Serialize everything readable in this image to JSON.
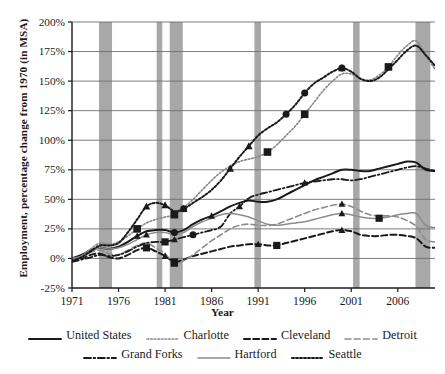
{
  "axes": {
    "ylabel": "Employment, percentage change from 1970 (in MSA)",
    "xlabel": "Year",
    "yticks": [
      "200%",
      "175%",
      "150%",
      "125%",
      "100%",
      "75%",
      "50%",
      "25%",
      "0%",
      "-25%"
    ],
    "xticks": [
      "1971",
      "1976",
      "1981",
      "1986",
      "1991",
      "1996",
      "2001",
      "2006"
    ]
  },
  "legend": {
    "row1": [
      {
        "label": "United States",
        "style": "solid-dark"
      },
      {
        "label": "Charlotte",
        "style": "dotted-gray"
      },
      {
        "label": "Cleveland",
        "style": "dashed-dark"
      },
      {
        "label": "Detroit",
        "style": "dashed-gray"
      }
    ],
    "row2": [
      {
        "label": "Grand Forks",
        "style": "dashdot-dark"
      },
      {
        "label": "Hartford",
        "style": "solid-gray"
      },
      {
        "label": "Seattle",
        "style": "dotted-dark"
      }
    ]
  },
  "colors": {
    "dark": "#1a1a1a",
    "gray": "#8c8c8c",
    "recession_band": "#a8a8a8",
    "gridline": "#6e6e6e",
    "axis": "#1a1a1a",
    "background": "#ffffff"
  },
  "chart_data": {
    "type": "line",
    "title": "",
    "xlabel": "Year",
    "ylabel": "Employment, percentage change from 1970 (in MSA)",
    "xlim": [
      1971,
      2010
    ],
    "ylim": [
      -25,
      200
    ],
    "ytick_values": [
      -25,
      0,
      25,
      50,
      75,
      100,
      125,
      150,
      175,
      200
    ],
    "xtick_values": [
      1971,
      1976,
      1981,
      1986,
      1991,
      1996,
      2001,
      2006
    ],
    "grid": "horizontal",
    "legend_position": "bottom",
    "units": "percent change from 1970",
    "recession_bands": [
      {
        "start": 1973.9,
        "end": 1975.3
      },
      {
        "start": 1980.1,
        "end": 1980.7
      },
      {
        "start": 1981.5,
        "end": 1982.9
      },
      {
        "start": 1990.6,
        "end": 1991.3
      },
      {
        "start": 2001.2,
        "end": 2001.9
      },
      {
        "start": 2007.9,
        "end": 2009.5
      }
    ],
    "x": [
      1971,
      1972,
      1973,
      1974,
      1975,
      1976,
      1977,
      1978,
      1979,
      1980,
      1981,
      1982,
      1983,
      1984,
      1985,
      1986,
      1987,
      1988,
      1989,
      1990,
      1991,
      1992,
      1993,
      1994,
      1995,
      1996,
      1997,
      1998,
      1999,
      2000,
      2001,
      2002,
      2003,
      2004,
      2005,
      2006,
      2007,
      2008,
      2009,
      2010
    ],
    "series": [
      {
        "name": "United States",
        "style": "solid-dark",
        "values": [
          0,
          3,
          7,
          9,
          8,
          10,
          14,
          19,
          23,
          24,
          24,
          22,
          24,
          29,
          33,
          36,
          40,
          44,
          47,
          49,
          48,
          48,
          50,
          54,
          58,
          62,
          66,
          69,
          72,
          75,
          75,
          74,
          74,
          76,
          78,
          80,
          82,
          81,
          75,
          74
        ]
      },
      {
        "name": "Charlotte",
        "style": "dotted-gray",
        "values": [
          -2,
          2,
          8,
          13,
          12,
          14,
          19,
          25,
          30,
          33,
          35,
          37,
          43,
          50,
          58,
          66,
          73,
          78,
          82,
          84,
          86,
          90,
          96,
          104,
          112,
          122,
          132,
          142,
          150,
          156,
          156,
          152,
          151,
          155,
          162,
          172,
          180,
          184,
          172,
          160
        ]
      },
      {
        "name": "Cleveland",
        "style": "dashed-dark",
        "values": [
          -2,
          0,
          3,
          4,
          1,
          0,
          3,
          7,
          9,
          6,
          2,
          -3,
          -1,
          2,
          4,
          6,
          8,
          10,
          11,
          12,
          12,
          11,
          11,
          13,
          15,
          17,
          19,
          21,
          23,
          24,
          23,
          20,
          19,
          19,
          20,
          20,
          19,
          17,
          10,
          9
        ]
      },
      {
        "name": "Detroit",
        "style": "dashed-gray",
        "values": [
          -1,
          1,
          5,
          7,
          4,
          3,
          7,
          11,
          13,
          9,
          4,
          -4,
          -2,
          3,
          9,
          15,
          20,
          25,
          28,
          29,
          28,
          28,
          29,
          32,
          35,
          38,
          41,
          43,
          45,
          46,
          44,
          40,
          37,
          36,
          36,
          35,
          32,
          27,
          16,
          14
        ]
      },
      {
        "name": "Grand Forks",
        "style": "dashdot-dark",
        "values": [
          -3,
          -1,
          1,
          3,
          2,
          3,
          6,
          10,
          13,
          14,
          14,
          16,
          18,
          20,
          22,
          24,
          27,
          38,
          44,
          51,
          54,
          56,
          58,
          60,
          62,
          64,
          65,
          66,
          67,
          67,
          66,
          67,
          69,
          71,
          73,
          75,
          77,
          78,
          76,
          74
        ]
      },
      {
        "name": "Hartford",
        "style": "solid-gray",
        "values": [
          0,
          2,
          6,
          9,
          8,
          9,
          12,
          16,
          20,
          22,
          22,
          20,
          22,
          27,
          31,
          34,
          37,
          38,
          37,
          35,
          32,
          29,
          28,
          29,
          30,
          31,
          33,
          35,
          37,
          38,
          37,
          35,
          34,
          34,
          35,
          37,
          38,
          38,
          28,
          26
        ]
      },
      {
        "name": "Seattle",
        "style": "dotted-dark",
        "values": [
          -2,
          1,
          6,
          11,
          11,
          13,
          22,
          33,
          44,
          47,
          45,
          40,
          42,
          47,
          52,
          58,
          66,
          76,
          86,
          95,
          104,
          110,
          115,
          122,
          130,
          140,
          148,
          153,
          158,
          161,
          158,
          152,
          150,
          153,
          160,
          168,
          176,
          180,
          172,
          163
        ]
      }
    ],
    "markers": {
      "note": "Filled triangle markers on Seattle and Detroit-like series; filled square markers on Charlotte and Cleveland; filled circle markers on Grand Forks",
      "triangle_points": [
        {
          "series": "Seattle",
          "x": 1979,
          "y": 10
        },
        {
          "series": "Seattle",
          "x": 1981,
          "y": 35
        },
        {
          "series": "Seattle",
          "x": 1990,
          "y": 104
        },
        {
          "series": "Seattle",
          "x": 1988,
          "y": 76
        },
        {
          "series": "Seattle",
          "x": 2000,
          "y": 161
        }
      ],
      "square_points": [
        {
          "series": "Charlotte",
          "x": 1978,
          "y": 17
        },
        {
          "series": "Charlotte",
          "x": 1982,
          "y": 37
        },
        {
          "series": "Charlotte",
          "x": 1992,
          "y": 86
        },
        {
          "series": "Charlotte",
          "x": 1996,
          "y": 125
        },
        {
          "series": "Charlotte",
          "x": 2005,
          "y": 162
        }
      ],
      "circle_points": [
        {
          "series": "Grand Forks",
          "x": 1984,
          "y": 24
        },
        {
          "series": "Grand Forks",
          "x": 1996,
          "y": 125
        },
        {
          "series": "Grand Forks",
          "x": 2000,
          "y": 161
        }
      ]
    }
  }
}
